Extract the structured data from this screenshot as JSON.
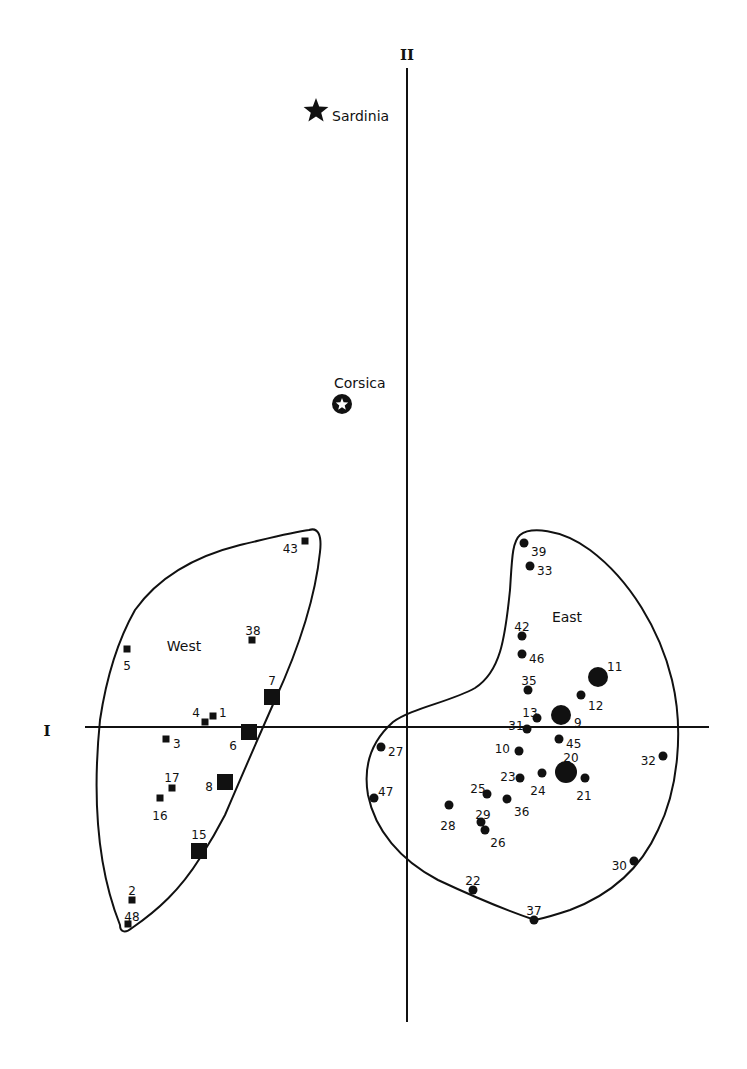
{
  "chart_data": {
    "type": "scatter",
    "title": "",
    "xlabel": "I",
    "ylabel": "II",
    "grid": false,
    "legend": null,
    "origin_px": [
      407,
      727
    ],
    "axes_px": {
      "horizontal": {
        "x1": 85,
        "x2": 709,
        "y": 727,
        "label": "I",
        "label_pos": [
          47,
          731
        ]
      },
      "vertical": {
        "x": 407,
        "y1": 68,
        "y2": 1022,
        "label": "II",
        "label_pos": [
          407,
          60
        ]
      }
    },
    "groups": [
      {
        "name": "West",
        "marker": "square",
        "label_pos": [
          184,
          651
        ],
        "contour_path": "M 309 530 C 318 527 322 535 320 552 C 315 600 298 650 275 700 C 255 745 240 780 225 815 C 212 840 205 850 200 858 C 180 890 158 910 132 928 C 126 933 120 933 120 925 C 98 870 92 800 100 720 C 106 680 118 640 135 610 C 160 575 200 555 240 545 C 270 538 293 532 309 530 Z",
        "points": [
          {
            "id": "1",
            "px": [
              213,
              716
            ],
            "size": 7,
            "label_pos": [
              219,
              713
            ],
            "anchor": "start"
          },
          {
            "id": "2",
            "px": [
              132,
              900
            ],
            "size": 7,
            "label_pos": [
              132,
              891
            ],
            "anchor": "middle"
          },
          {
            "id": "3",
            "px": [
              166,
              739
            ],
            "size": 7,
            "label_pos": [
              173,
              744
            ],
            "anchor": "start"
          },
          {
            "id": "4",
            "px": [
              205,
              722
            ],
            "size": 7,
            "label_pos": [
              196,
              713
            ],
            "anchor": "middle"
          },
          {
            "id": "5",
            "px": [
              127,
              649
            ],
            "size": 7,
            "label_pos": [
              127,
              666
            ],
            "anchor": "middle"
          },
          {
            "id": "6",
            "px": [
              249,
              732
            ],
            "size": 16,
            "label_pos": [
              233,
              746
            ],
            "anchor": "middle"
          },
          {
            "id": "7",
            "px": [
              272,
              697
            ],
            "size": 16,
            "label_pos": [
              272,
              681
            ],
            "anchor": "middle"
          },
          {
            "id": "8",
            "px": [
              225,
              782
            ],
            "size": 16,
            "label_pos": [
              209,
              787
            ],
            "anchor": "middle"
          },
          {
            "id": "15",
            "px": [
              199,
              851
            ],
            "size": 16,
            "label_pos": [
              199,
              835
            ],
            "anchor": "middle"
          },
          {
            "id": "16",
            "px": [
              160,
              798
            ],
            "size": 7,
            "label_pos": [
              160,
              816
            ],
            "anchor": "middle"
          },
          {
            "id": "17",
            "px": [
              172,
              788
            ],
            "size": 7,
            "label_pos": [
              172,
              778
            ],
            "anchor": "middle"
          },
          {
            "id": "38",
            "px": [
              252,
              640
            ],
            "size": 7,
            "label_pos": [
              253,
              631
            ],
            "anchor": "middle"
          },
          {
            "id": "43",
            "px": [
              305,
              541
            ],
            "size": 7,
            "label_pos": [
              298,
              549
            ],
            "anchor": "end"
          },
          {
            "id": "48",
            "px": [
              128,
              924
            ],
            "size": 7,
            "label_pos": [
              132,
              917
            ],
            "anchor": "middle"
          }
        ]
      },
      {
        "name": "East",
        "marker": "circle",
        "label_pos": [
          567,
          622
        ],
        "contour_path": "M 520 535 C 530 527 560 528 590 550 C 630 580 660 630 672 680 C 684 730 678 790 658 830 C 640 870 610 895 570 910 C 555 915 545 918 535 920 C 505 910 470 895 438 880 C 400 860 375 830 368 795 C 362 760 375 738 393 722 C 412 708 450 702 475 688 C 500 672 505 640 510 590 C 512 560 512 542 520 535 Z",
        "points": [
          {
            "id": "9",
            "px": [
              561,
              715
            ],
            "size": 20,
            "label_pos": [
              574,
              723
            ],
            "anchor": "start"
          },
          {
            "id": "10",
            "px": [
              519,
              751
            ],
            "size": 9,
            "label_pos": [
              510,
              749
            ],
            "anchor": "end"
          },
          {
            "id": "11",
            "px": [
              598,
              677
            ],
            "size": 20,
            "label_pos": [
              607,
              667
            ],
            "anchor": "start"
          },
          {
            "id": "12",
            "px": [
              581,
              695
            ],
            "size": 9,
            "label_pos": [
              588,
              706
            ],
            "anchor": "start"
          },
          {
            "id": "13",
            "px": [
              537,
              718
            ],
            "size": 9,
            "label_pos": [
              530,
              713
            ],
            "anchor": "middle"
          },
          {
            "id": "20",
            "px": [
              566,
              772
            ],
            "size": 22,
            "label_pos": [
              571,
              758
            ],
            "anchor": "middle"
          },
          {
            "id": "21",
            "px": [
              585,
              778
            ],
            "size": 9,
            "label_pos": [
              584,
              796
            ],
            "anchor": "middle"
          },
          {
            "id": "22",
            "px": [
              473,
              890
            ],
            "size": 9,
            "label_pos": [
              473,
              881
            ],
            "anchor": "middle"
          },
          {
            "id": "23",
            "px": [
              520,
              778
            ],
            "size": 9,
            "label_pos": [
              508,
              777
            ],
            "anchor": "middle"
          },
          {
            "id": "24",
            "px": [
              542,
              773
            ],
            "size": 9,
            "label_pos": [
              538,
              791
            ],
            "anchor": "middle"
          },
          {
            "id": "25",
            "px": [
              487,
              794
            ],
            "size": 9,
            "label_pos": [
              478,
              789
            ],
            "anchor": "middle"
          },
          {
            "id": "26",
            "px": [
              485,
              830
            ],
            "size": 9,
            "label_pos": [
              498,
              843
            ],
            "anchor": "middle"
          },
          {
            "id": "27",
            "px": [
              381,
              747
            ],
            "size": 9,
            "label_pos": [
              388,
              752
            ],
            "anchor": "start"
          },
          {
            "id": "28",
            "px": [
              449,
              805
            ],
            "size": 9,
            "label_pos": [
              448,
              826
            ],
            "anchor": "middle"
          },
          {
            "id": "29",
            "px": [
              481,
              822
            ],
            "size": 9,
            "label_pos": [
              483,
              815
            ],
            "anchor": "middle"
          },
          {
            "id": "30",
            "px": [
              634,
              861
            ],
            "size": 9,
            "label_pos": [
              627,
              866
            ],
            "anchor": "end"
          },
          {
            "id": "31",
            "px": [
              527,
              729
            ],
            "size": 9,
            "label_pos": [
              516,
              726
            ],
            "anchor": "middle"
          },
          {
            "id": "32",
            "px": [
              663,
              756
            ],
            "size": 9,
            "label_pos": [
              656,
              761
            ],
            "anchor": "end"
          },
          {
            "id": "33",
            "px": [
              530,
              566
            ],
            "size": 9,
            "label_pos": [
              537,
              571
            ],
            "anchor": "start"
          },
          {
            "id": "35",
            "px": [
              528,
              690
            ],
            "size": 9,
            "label_pos": [
              529,
              681
            ],
            "anchor": "middle"
          },
          {
            "id": "36",
            "px": [
              507,
              799
            ],
            "size": 9,
            "label_pos": [
              514,
              812
            ],
            "anchor": "start"
          },
          {
            "id": "37",
            "px": [
              534,
              920
            ],
            "size": 9,
            "label_pos": [
              534,
              911
            ],
            "anchor": "middle"
          },
          {
            "id": "39",
            "px": [
              524,
              543
            ],
            "size": 9,
            "label_pos": [
              531,
              552
            ],
            "anchor": "start"
          },
          {
            "id": "42",
            "px": [
              522,
              636
            ],
            "size": 9,
            "label_pos": [
              522,
              627
            ],
            "anchor": "middle"
          },
          {
            "id": "45",
            "px": [
              559,
              739
            ],
            "size": 9,
            "label_pos": [
              566,
              744
            ],
            "anchor": "start"
          },
          {
            "id": "46",
            "px": [
              522,
              654
            ],
            "size": 9,
            "label_pos": [
              529,
              659
            ],
            "anchor": "start"
          },
          {
            "id": "47",
            "px": [
              374,
              798
            ],
            "size": 9,
            "label_pos": [
              378,
              792
            ],
            "anchor": "start"
          }
        ]
      }
    ],
    "islands": [
      {
        "name": "Sardinia",
        "marker": "filled-star",
        "px": [
          316,
          111
        ],
        "label": "Sardinia",
        "label_pos": [
          332,
          121
        ]
      },
      {
        "name": "Corsica",
        "marker": "circled-star",
        "px": [
          342,
          404
        ],
        "label": "Corsica",
        "label_pos": [
          334,
          388
        ]
      }
    ]
  }
}
